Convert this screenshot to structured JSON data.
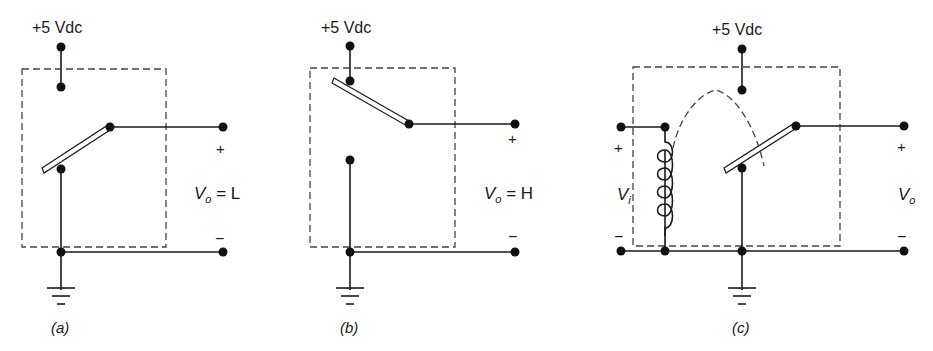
{
  "figure": {
    "panels": [
      {
        "id": "a",
        "caption": "(a)",
        "supply_label": "+5 Vdc",
        "output_label": "V",
        "output_sub": "o",
        "output_state": " = L",
        "plus": "+",
        "minus": "−",
        "switch_position": "grounded"
      },
      {
        "id": "b",
        "caption": "(b)",
        "supply_label": "+5 Vdc",
        "output_label": "V",
        "output_sub": "o",
        "output_state": " = H",
        "plus": "+",
        "minus": "−",
        "switch_position": "to +5 Vdc"
      },
      {
        "id": "c",
        "caption": "(c)",
        "supply_label": "+5 Vdc",
        "input_label": "V",
        "input_sub": "i",
        "output_label": "V",
        "output_sub": "o",
        "in_plus": "+",
        "in_minus": "−",
        "plus": "+",
        "minus": "−",
        "switch_position": "relay coil actuated"
      }
    ]
  }
}
